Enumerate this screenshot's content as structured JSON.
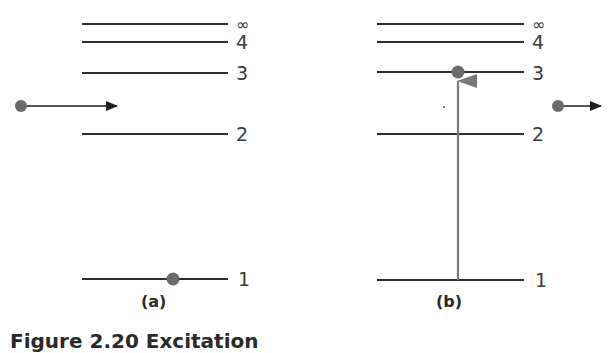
{
  "figure": {
    "caption": "Figure 2.20 Excitation",
    "colors": {
      "level_line": "#2e2e2e",
      "electron": "#6b6b6b",
      "arrow_black": "#1e1e1e",
      "excitation_arrow": "#7a7a7a",
      "label": "#3a3a3a"
    },
    "panels": [
      {
        "id": "a",
        "label": "(a)",
        "levels": [
          {
            "n": "∞",
            "y": 24
          },
          {
            "n": "4",
            "y": 42
          },
          {
            "n": "3",
            "y": 73
          },
          {
            "n": "2",
            "y": 134
          },
          {
            "n": "1",
            "y": 279
          }
        ],
        "incoming_electron": {
          "x": 21,
          "y": 106,
          "arrow_to_x": 117
        },
        "bound_electron": {
          "level": "1",
          "x": 173,
          "y": 279
        }
      },
      {
        "id": "b",
        "label": "(b)",
        "levels": [
          {
            "n": "∞",
            "y": 24
          },
          {
            "n": "4",
            "y": 42
          },
          {
            "n": "3",
            "y": 73
          },
          {
            "n": "2",
            "y": 134
          },
          {
            "n": "1",
            "y": 279
          }
        ],
        "excitation": {
          "from_level": "1",
          "to_level": "3",
          "x": 458
        },
        "excited_electron": {
          "level": "3",
          "x": 458,
          "y": 72
        },
        "outgoing_electron": {
          "x": 558,
          "y": 106,
          "arrow_to_x": 601
        }
      }
    ]
  }
}
